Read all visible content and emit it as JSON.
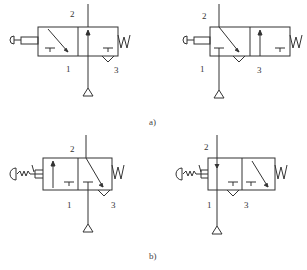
{
  "figure": {
    "subfigures": [
      {
        "caption": "a)",
        "valves": [
          {
            "id": "a-left",
            "actuator": "push-button-plunger",
            "return": "spring",
            "ports": {
              "p2": "2",
              "p1": "1",
              "p3": "3"
            }
          },
          {
            "id": "a-right",
            "actuator": "push-button-plunger",
            "return": "spring",
            "ports": {
              "p2": "2",
              "p1": "1",
              "p3": "3"
            }
          }
        ]
      },
      {
        "caption": "b)",
        "valves": [
          {
            "id": "b-left",
            "actuator": "mushroom-button-with-detent",
            "return": "spring",
            "ports": {
              "p2": "2",
              "p1": "1",
              "p3": "3"
            }
          },
          {
            "id": "b-right",
            "actuator": "mushroom-button-with-detent",
            "return": "spring",
            "ports": {
              "p2": "2",
              "p1": "1",
              "p3": "3"
            }
          }
        ]
      }
    ],
    "colors": {
      "line": "#333333",
      "background": "#ffffff"
    }
  }
}
